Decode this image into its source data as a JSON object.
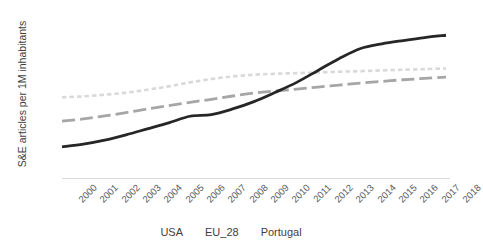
{
  "chart_data": {
    "type": "line",
    "title": "",
    "xlabel": "",
    "ylabel": "S&E articles per 1M inhabitants",
    "x": [
      2000,
      2001,
      2002,
      2003,
      2004,
      2005,
      2006,
      2007,
      2008,
      2009,
      2010,
      2011,
      2012,
      2013,
      2014,
      2015,
      2016,
      2017,
      2018
    ],
    "categories": [
      "2000",
      "2001",
      "2002",
      "2003",
      "2004",
      "2005",
      "2006",
      "2007",
      "2008",
      "2009",
      "2010",
      "2011",
      "2012",
      "2013",
      "2014",
      "2015",
      "2016",
      "2017",
      "2018"
    ],
    "ylim": [
      0,
      2500
    ],
    "yticks": [
      0,
      500,
      1000,
      1500,
      2000,
      2500
    ],
    "ytick_labels": [
      "0",
      "500",
      "1000",
      "1500",
      "2000",
      "2500"
    ],
    "grid": false,
    "legend_position": "bottom",
    "series": [
      {
        "name": "USA",
        "color": "#d9d9d9",
        "style": "dotted",
        "values": [
          1215,
          1230,
          1255,
          1285,
          1330,
          1380,
          1440,
          1490,
          1530,
          1555,
          1570,
          1580,
          1590,
          1600,
          1610,
          1620,
          1630,
          1640,
          1650
        ]
      },
      {
        "name": "EU_28",
        "color": "#a6a6a6",
        "style": "dashed",
        "values": [
          855,
          890,
          935,
          985,
          1040,
          1090,
          1140,
          1185,
          1235,
          1280,
          1310,
          1340,
          1370,
          1400,
          1430,
          1455,
          1480,
          1500,
          1520
        ]
      },
      {
        "name": "Portugal",
        "color": "#262626",
        "style": "solid",
        "values": [
          470,
          510,
          570,
          650,
          740,
          830,
          930,
          955,
          1040,
          1150,
          1290,
          1440,
          1620,
          1800,
          1950,
          2020,
          2070,
          2115,
          2150
        ]
      }
    ]
  },
  "legend": {
    "items": [
      {
        "label": "USA"
      },
      {
        "label": "EU_28"
      },
      {
        "label": "Portugal"
      }
    ]
  }
}
